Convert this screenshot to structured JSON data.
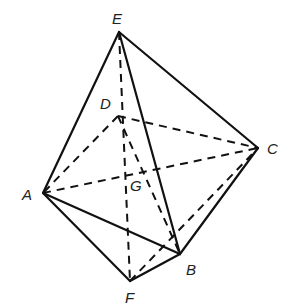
{
  "diagram": {
    "type": "octahedron-like solid",
    "stroke_color": "#111111",
    "vertices": {
      "E": {
        "label": "E",
        "x": 119,
        "y": 32
      },
      "D": {
        "label": "D",
        "x": 118,
        "y": 116
      },
      "C": {
        "label": "C",
        "x": 258,
        "y": 148
      },
      "A": {
        "label": "A",
        "x": 43,
        "y": 193
      },
      "B": {
        "label": "B",
        "x": 180,
        "y": 254
      },
      "F": {
        "label": "F",
        "x": 130,
        "y": 281
      },
      "G": {
        "label": "G",
        "x": 145,
        "y": 175
      }
    },
    "solid_edges": [
      [
        "E",
        "A"
      ],
      [
        "E",
        "C"
      ],
      [
        "E",
        "B"
      ],
      [
        "A",
        "B"
      ],
      [
        "A",
        "F"
      ],
      [
        "F",
        "B"
      ],
      [
        "B",
        "C"
      ]
    ],
    "dashed_edges": [
      [
        "E",
        "F"
      ],
      [
        "D",
        "C"
      ],
      [
        "D",
        "A"
      ],
      [
        "A",
        "C"
      ],
      [
        "D",
        "B"
      ],
      [
        "F",
        "C"
      ]
    ]
  }
}
